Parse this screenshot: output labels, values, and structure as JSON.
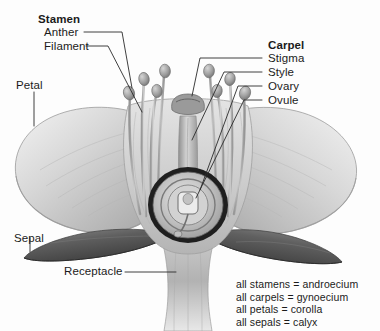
{
  "figure": {
    "background_color": "#fdfdfd",
    "label_color": "#1b1b1b",
    "line_color": "#2a2a2a"
  },
  "labels": {
    "stamen": "Stamen",
    "anther": "Anther",
    "filament": "Filament",
    "petal": "Petal",
    "sepal": "Sepal",
    "receptacle": "Receptacle",
    "carpel": "Carpel",
    "stigma": "Stigma",
    "style": "Style",
    "ovary": "Ovary",
    "ovule": "Ovule"
  },
  "legend": {
    "lines": [
      "all stamens = androecium",
      "all carpels = gynoecium",
      "all petals = corolla",
      "all sepals = calyx"
    ]
  }
}
